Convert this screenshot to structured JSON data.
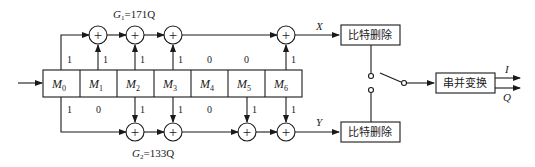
{
  "diagram": {
    "type": "convolutional-encoder-with-puncturing",
    "input": {
      "label": ""
    },
    "register": {
      "cells": [
        "M",
        "M",
        "M",
        "M",
        "M",
        "M",
        "M"
      ],
      "subscripts": [
        "0",
        "1",
        "2",
        "3",
        "4",
        "5",
        "6"
      ]
    },
    "generator_top": {
      "name": "G",
      "subscript": "1",
      "value": "=171Q",
      "taps": [
        "1",
        "1",
        "1",
        "1",
        "0",
        "0",
        "1"
      ],
      "output_label": "X"
    },
    "generator_bottom": {
      "name": "G",
      "subscript": "2",
      "value": "=133Q",
      "taps": [
        "1",
        "0",
        "1",
        "1",
        "0",
        "1",
        "1"
      ],
      "output_label": "Y"
    },
    "blocks": {
      "puncture_top": "比特删除",
      "puncture_bottom": "比特删除",
      "serial_parallel": "串并变换"
    },
    "outputs": {
      "i": "I",
      "q": "Q"
    },
    "adder_symbol": "+",
    "colors": {
      "stroke": "#1a1a1a",
      "background": "#ffffff"
    }
  }
}
